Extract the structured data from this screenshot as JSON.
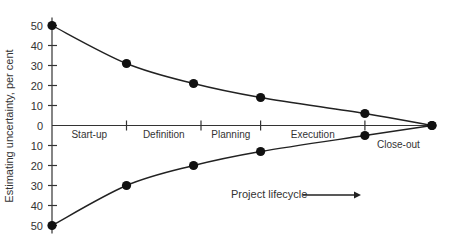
{
  "chart_data": {
    "type": "line",
    "title": "",
    "xlabel": "",
    "ylabel": "Estimating uncertainty, per cent",
    "annotation": "Project lifecycle",
    "annotation_arrow": "right",
    "y_ticks_upper": [
      "50",
      "40",
      "30",
      "20",
      "10",
      "0"
    ],
    "y_ticks_lower": [
      "10",
      "20",
      "30",
      "40",
      "50"
    ],
    "ylim": [
      -50,
      50
    ],
    "grid": false,
    "phases": [
      "Start-up",
      "Definition",
      "Planning",
      "Execution",
      "Close-out"
    ],
    "x_stage_positions": [
      0,
      1,
      1.9,
      2.8,
      4.2,
      5.1
    ],
    "phase_boundaries": [
      1,
      2.0,
      2.8,
      4.2
    ],
    "series": [
      {
        "name": "Upper bound",
        "x": [
          0,
          1,
          1.9,
          2.8,
          4.2,
          5.1
        ],
        "values": [
          50,
          31,
          21,
          14,
          6,
          0
        ]
      },
      {
        "name": "Lower bound",
        "x": [
          0,
          1,
          1.9,
          2.8,
          4.2,
          5.1
        ],
        "values": [
          -50,
          -30,
          -20,
          -13,
          -5,
          0
        ]
      }
    ]
  }
}
